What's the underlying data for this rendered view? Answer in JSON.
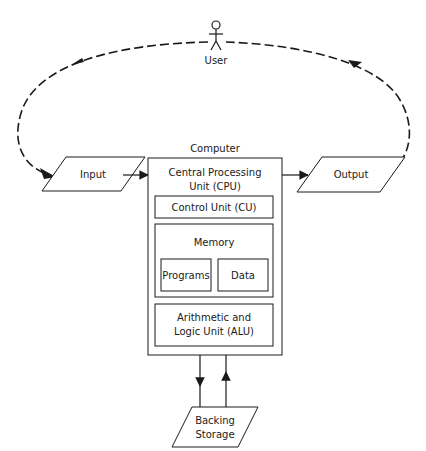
{
  "diagram": {
    "user": {
      "label": "User"
    },
    "input": {
      "label": "Input"
    },
    "output": {
      "label": "Output"
    },
    "computer": {
      "label": "Computer",
      "cpu": {
        "line1": "Central Processing",
        "line2": "Unit (CPU)"
      },
      "control_unit": {
        "label": "Control Unit (CU)"
      },
      "memory": {
        "label": "Memory",
        "programs": {
          "label": "Programs"
        },
        "data": {
          "label": "Data"
        }
      },
      "alu": {
        "line1": "Arithmetic and",
        "line2": "Logic Unit (ALU)"
      }
    },
    "backing_storage": {
      "line1": "Backing",
      "line2": "Storage"
    },
    "colors": {
      "stroke": "#1a1a1a",
      "background": "#ffffff"
    }
  }
}
